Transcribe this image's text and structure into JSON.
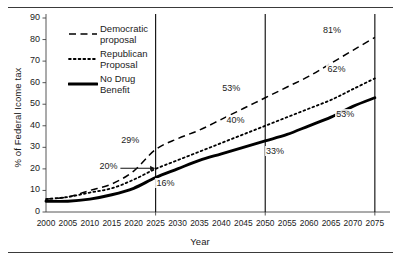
{
  "chart_data": {
    "type": "line",
    "title": "",
    "xlabel": "Year",
    "ylabel": "% of Federal Icome tax",
    "xlim": [
      2000,
      2078
    ],
    "ylim": [
      0,
      90
    ],
    "grid": false,
    "legend_position": "upper-left-inside",
    "xticks": [
      "2000",
      "2005",
      "2010",
      "2015",
      "2020",
      "2025",
      "2030",
      "2035",
      "2040",
      "2045",
      "2050",
      "2055",
      "2060",
      "2065",
      "2070",
      "2075"
    ],
    "yticks": [
      "0",
      "10",
      "20",
      "30",
      "40",
      "50",
      "60",
      "70",
      "80",
      "90"
    ],
    "x": [
      2000,
      2005,
      2010,
      2015,
      2020,
      2025,
      2030,
      2035,
      2040,
      2045,
      2050,
      2055,
      2060,
      2065,
      2070,
      2075
    ],
    "series": [
      {
        "name": "Democratic proposal",
        "style": "dashed",
        "color": "#000000",
        "values": [
          6,
          7,
          10,
          13,
          19,
          29,
          34,
          38,
          43,
          48,
          53,
          58,
          63,
          69,
          75,
          81
        ]
      },
      {
        "name": "Republican Proposal",
        "style": "dotted",
        "color": "#000000",
        "values": [
          6,
          7,
          9,
          11,
          15,
          20,
          24,
          28,
          32,
          36,
          40,
          44,
          48,
          52,
          57,
          62
        ]
      },
      {
        "name": "No Drug Benefit",
        "style": "solid",
        "color": "#000000",
        "values": [
          5,
          5,
          6,
          8,
          11,
          16,
          20,
          24,
          27,
          30,
          33,
          36,
          40,
          44,
          49,
          53
        ]
      }
    ],
    "reference_lines": [
      {
        "x": 2025,
        "label": "2025"
      },
      {
        "x": 2050,
        "label": "2050"
      },
      {
        "x": 2075,
        "label": "2075"
      }
    ],
    "annotations": [
      {
        "text": "20%",
        "x": 2014,
        "y": 21,
        "series": "Republican Proposal",
        "has_arrow": true,
        "arrow_to_x": 2025
      },
      {
        "text": "29%",
        "x": 2019,
        "y": 33,
        "series": "Democratic proposal",
        "has_arrow": false
      },
      {
        "text": "16%",
        "x": 2027,
        "y": 13,
        "series": "No Drug Benefit",
        "has_arrow": false
      },
      {
        "text": "53%",
        "x": 2042,
        "y": 57,
        "series": "Democratic proposal",
        "has_arrow": false
      },
      {
        "text": "40%",
        "x": 2043,
        "y": 42,
        "series": "Republican Proposal",
        "has_arrow": false
      },
      {
        "text": "33%",
        "x": 2052,
        "y": 28,
        "series": "No Drug Benefit",
        "has_arrow": false
      },
      {
        "text": "81%",
        "x": 2065,
        "y": 84,
        "series": "Democratic proposal",
        "has_arrow": false
      },
      {
        "text": "62%",
        "x": 2066,
        "y": 66,
        "series": "Republican Proposal",
        "has_arrow": false
      },
      {
        "text": "53%",
        "x": 2068,
        "y": 45,
        "series": "No Drug Benefit",
        "has_arrow": false
      }
    ],
    "legend": [
      {
        "label_line1": "Democratic",
        "label_line2": "proposal",
        "style": "dashed"
      },
      {
        "label_line1": "Republican",
        "label_line2": "Proposal",
        "style": "dotted"
      },
      {
        "label_line1": "No Drug",
        "label_line2": "Benefit",
        "style": "solid"
      }
    ]
  }
}
